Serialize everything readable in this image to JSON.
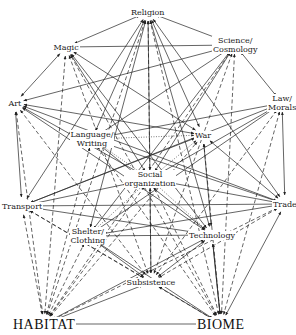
{
  "diagram": {
    "nodes": [
      {
        "id": "religion",
        "label": "Religion",
        "x": 148,
        "y": 12
      },
      {
        "id": "magic",
        "label": "Magic",
        "x": 66,
        "y": 47
      },
      {
        "id": "science",
        "label": "Science/\nCosmology",
        "x": 235,
        "y": 45
      },
      {
        "id": "art",
        "label": "Art",
        "x": 15,
        "y": 103
      },
      {
        "id": "law",
        "label": "Law/\nMorals",
        "x": 282,
        "y": 103
      },
      {
        "id": "language",
        "label": "Language/\nWriting",
        "x": 92,
        "y": 139
      },
      {
        "id": "war",
        "label": "War",
        "x": 203,
        "y": 135
      },
      {
        "id": "social",
        "label": "Social\norganization",
        "x": 150,
        "y": 179
      },
      {
        "id": "transport",
        "label": "Transport",
        "x": 22,
        "y": 206
      },
      {
        "id": "trade",
        "label": "Trade",
        "x": 285,
        "y": 204
      },
      {
        "id": "shelter",
        "label": "Shelter/\nClothing",
        "x": 88,
        "y": 236
      },
      {
        "id": "technology",
        "label": "Technology",
        "x": 212,
        "y": 235
      },
      {
        "id": "subsistence",
        "label": "Subsistence",
        "x": 151,
        "y": 282
      },
      {
        "id": "habitat",
        "label": "HABITAT",
        "x": 44,
        "y": 324,
        "big": true
      },
      {
        "id": "biome",
        "label": "BIOME",
        "x": 221,
        "y": 324,
        "big": true
      }
    ],
    "edges": [
      {
        "from": "religion",
        "to": "magic",
        "style": "solid"
      },
      {
        "from": "religion",
        "to": "science",
        "style": "solid"
      },
      {
        "from": "magic",
        "to": "science",
        "style": "solid"
      },
      {
        "from": "magic",
        "to": "art",
        "style": "solid"
      },
      {
        "from": "science",
        "to": "law",
        "style": "solid"
      },
      {
        "from": "art",
        "to": "transport",
        "style": "solid"
      },
      {
        "from": "law",
        "to": "trade",
        "style": "solid"
      },
      {
        "from": "habitat",
        "to": "biome",
        "style": "solid"
      },
      {
        "from": "art",
        "to": "science",
        "style": "solid"
      },
      {
        "from": "religion",
        "to": "social",
        "style": "solid"
      },
      {
        "from": "religion",
        "to": "war",
        "style": "solid"
      },
      {
        "from": "religion",
        "to": "language",
        "style": "solid"
      },
      {
        "from": "religion",
        "to": "technology",
        "style": "solid"
      },
      {
        "from": "religion",
        "to": "shelter",
        "style": "solid"
      },
      {
        "from": "religion",
        "to": "subsistence",
        "style": "dashed"
      },
      {
        "from": "religion",
        "to": "trade",
        "style": "solid"
      },
      {
        "from": "religion",
        "to": "transport",
        "style": "solid"
      },
      {
        "from": "magic",
        "to": "social",
        "style": "solid"
      },
      {
        "from": "magic",
        "to": "war",
        "style": "solid"
      },
      {
        "from": "magic",
        "to": "subsistence",
        "style": "dashed"
      },
      {
        "from": "magic",
        "to": "technology",
        "style": "solid"
      },
      {
        "from": "magic",
        "to": "habitat",
        "style": "dashed"
      },
      {
        "from": "science",
        "to": "social",
        "style": "solid"
      },
      {
        "from": "science",
        "to": "language",
        "style": "solid"
      },
      {
        "from": "science",
        "to": "subsistence",
        "style": "dashed"
      },
      {
        "from": "science",
        "to": "shelter",
        "style": "solid"
      },
      {
        "from": "science",
        "to": "biome",
        "style": "dashed"
      },
      {
        "from": "art",
        "to": "social",
        "style": "solid"
      },
      {
        "from": "art",
        "to": "war",
        "style": "solid"
      },
      {
        "from": "art",
        "to": "trade",
        "style": "solid"
      },
      {
        "from": "art",
        "to": "technology",
        "style": "solid"
      },
      {
        "from": "art",
        "to": "subsistence",
        "style": "dashed"
      },
      {
        "from": "art",
        "to": "habitat",
        "style": "dashed"
      },
      {
        "from": "law",
        "to": "social",
        "style": "solid"
      },
      {
        "from": "law",
        "to": "language",
        "style": "solid"
      },
      {
        "from": "law",
        "to": "transport",
        "style": "solid"
      },
      {
        "from": "law",
        "to": "shelter",
        "style": "solid"
      },
      {
        "from": "law",
        "to": "subsistence",
        "style": "dashed"
      },
      {
        "from": "law",
        "to": "biome",
        "style": "dashed"
      },
      {
        "from": "language",
        "to": "war",
        "style": "dotted"
      },
      {
        "from": "language",
        "to": "social",
        "style": "dotted"
      },
      {
        "from": "war",
        "to": "social",
        "style": "dotted"
      },
      {
        "from": "social",
        "to": "transport",
        "style": "solid"
      },
      {
        "from": "social",
        "to": "trade",
        "style": "solid"
      },
      {
        "from": "social",
        "to": "shelter",
        "style": "dotted"
      },
      {
        "from": "social",
        "to": "technology",
        "style": "dotted"
      },
      {
        "from": "social",
        "to": "subsistence",
        "style": "solid"
      },
      {
        "from": "transport",
        "to": "trade",
        "style": "solid"
      },
      {
        "from": "transport",
        "to": "technology",
        "style": "solid"
      },
      {
        "from": "transport",
        "to": "subsistence",
        "style": "dashed"
      },
      {
        "from": "transport",
        "to": "habitat",
        "style": "dashed"
      },
      {
        "from": "trade",
        "to": "shelter",
        "style": "solid"
      },
      {
        "from": "trade",
        "to": "subsistence",
        "style": "dashed"
      },
      {
        "from": "trade",
        "to": "biome",
        "style": "solid"
      },
      {
        "from": "shelter",
        "to": "technology",
        "style": "solid"
      },
      {
        "from": "shelter",
        "to": "subsistence",
        "style": "solid"
      },
      {
        "from": "technology",
        "to": "subsistence",
        "style": "solid"
      },
      {
        "from": "technology",
        "to": "biome",
        "style": "solid"
      },
      {
        "from": "subsistence",
        "to": "habitat",
        "style": "solid"
      },
      {
        "from": "subsistence",
        "to": "biome",
        "style": "solid"
      },
      {
        "from": "habitat",
        "to": "shelter",
        "style": "dashed"
      },
      {
        "from": "habitat",
        "to": "technology",
        "style": "solid"
      },
      {
        "from": "habitat",
        "to": "social",
        "style": "dashed"
      },
      {
        "from": "habitat",
        "to": "language",
        "style": "dashed"
      },
      {
        "from": "habitat",
        "to": "war",
        "style": "dashed"
      },
      {
        "from": "habitat",
        "to": "trade",
        "style": "dashed"
      },
      {
        "from": "habitat",
        "to": "religion",
        "style": "dashed"
      },
      {
        "from": "biome",
        "to": "shelter",
        "style": "solid"
      },
      {
        "from": "biome",
        "to": "technology",
        "style": "solid"
      },
      {
        "from": "biome",
        "to": "social",
        "style": "dashed"
      },
      {
        "from": "biome",
        "to": "war",
        "style": "dashed"
      },
      {
        "from": "biome",
        "to": "language",
        "style": "dashed"
      },
      {
        "from": "biome",
        "to": "transport",
        "style": "dashed"
      },
      {
        "from": "biome",
        "to": "religion",
        "style": "dashed"
      },
      {
        "from": "biome",
        "to": "magic",
        "style": "dashed"
      },
      {
        "from": "habitat",
        "to": "science",
        "style": "dashed"
      },
      {
        "from": "war",
        "to": "trade",
        "style": "solid"
      },
      {
        "from": "war",
        "to": "transport",
        "style": "solid"
      },
      {
        "from": "war",
        "to": "technology",
        "style": "solid"
      },
      {
        "from": "language",
        "to": "trade",
        "style": "solid"
      },
      {
        "from": "language",
        "to": "technology",
        "style": "solid"
      }
    ]
  }
}
